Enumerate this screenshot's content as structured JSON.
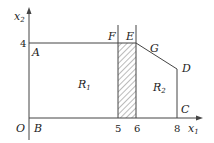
{
  "diagram": {
    "axes": {
      "x_label": "x",
      "x_sub": "1",
      "y_label": "x",
      "y_sub": "2",
      "origin": "O"
    },
    "ticks": {
      "y": [
        "4"
      ],
      "x": [
        "5",
        "6",
        "8"
      ]
    },
    "points": {
      "A": "A",
      "B": "B",
      "C": "C",
      "D": "D",
      "E": "E",
      "F": "F",
      "G": "G"
    },
    "regions": {
      "R1": {
        "label": "R",
        "sub": "1"
      },
      "R2": {
        "label": "R",
        "sub": "2"
      }
    },
    "shaded_region": {
      "x_from": 5,
      "x_to": 6,
      "pattern": "diagonal-hatch"
    },
    "colors": {
      "line": "#444444",
      "text": "#222222",
      "hatch": "#555555"
    }
  }
}
